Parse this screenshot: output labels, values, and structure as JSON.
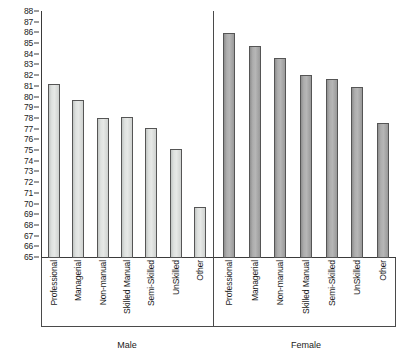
{
  "chart_data": {
    "type": "bar",
    "title": "",
    "xlabel": "",
    "ylabel": "",
    "ylim": [
      65,
      88
    ],
    "ytick_step": 1,
    "grid": false,
    "legend": "none",
    "panels": [
      "Male",
      "Female"
    ],
    "categories": [
      "Professional",
      "Managerial",
      "Non-manual",
      "Skilled Manual",
      "Semi-Skilled",
      "UnSkilled",
      "Other"
    ],
    "series": [
      {
        "name": "Male",
        "values": [
          81.3,
          79.8,
          78.1,
          78.2,
          77.2,
          75.2,
          69.8
        ]
      },
      {
        "name": "Female",
        "values": [
          86.0,
          84.8,
          83.7,
          82.1,
          81.7,
          81.0,
          77.6
        ]
      }
    ],
    "yticks": [
      88,
      87,
      86,
      85,
      84,
      83,
      82,
      81,
      80,
      79,
      78,
      77,
      76,
      75,
      74,
      73,
      72,
      71,
      70,
      69,
      68,
      67,
      66,
      65
    ],
    "colors": {
      "male_bar": "#e0e3e1",
      "female_bar": "#aeaeae",
      "bar_outline": "#555555",
      "axis": "#3a3a3a",
      "text": "#1a1a1a"
    }
  },
  "groups": {
    "male_label": "Male",
    "female_label": "Female"
  }
}
